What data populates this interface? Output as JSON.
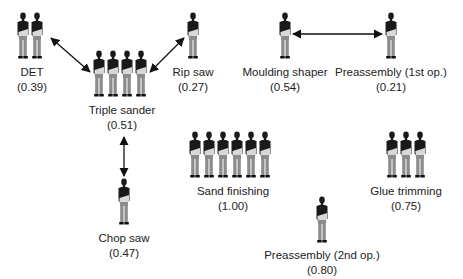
{
  "stations": [
    {
      "id": "det",
      "name": "DET",
      "value": "(0.39)",
      "workers": 2,
      "x": 16,
      "y": 12,
      "label_x": 32,
      "label_y": 65
    },
    {
      "id": "triple-sander",
      "name": "Triple sander",
      "value": "(0.51)",
      "workers": 4,
      "x": 92,
      "y": 50,
      "label_x": 122,
      "label_y": 103
    },
    {
      "id": "rip-saw",
      "name": "Rip saw",
      "value": "(0.27)",
      "workers": 1,
      "x": 186,
      "y": 12,
      "label_x": 193,
      "label_y": 65
    },
    {
      "id": "moulding-shaper",
      "name": "Moulding shaper",
      "value": "(0.54)",
      "workers": 1,
      "x": 278,
      "y": 12,
      "label_x": 285,
      "label_y": 65
    },
    {
      "id": "preassembly-1st",
      "name": "Preassembly (1st op.)",
      "value": "(0.21)",
      "workers": 1,
      "x": 384,
      "y": 12,
      "label_x": 391,
      "label_y": 65
    },
    {
      "id": "sand-finishing",
      "name": "Sand finishing",
      "value": "(1.00)",
      "workers": 6,
      "x": 188,
      "y": 131,
      "label_x": 233,
      "label_y": 184
    },
    {
      "id": "chop-saw",
      "name": "Chop saw",
      "value": "(0.47)",
      "workers": 1,
      "x": 117,
      "y": 178,
      "label_x": 124,
      "label_y": 231
    },
    {
      "id": "glue-trimming",
      "name": "Glue trimming",
      "value": "(0.75)",
      "workers": 3,
      "x": 385,
      "y": 131,
      "label_x": 406,
      "label_y": 184
    },
    {
      "id": "preassembly-2nd",
      "name": "Preassembly (2nd op.)",
      "value": "(0.80)",
      "workers": 1,
      "x": 315,
      "y": 196,
      "label_x": 322,
      "label_y": 248
    }
  ],
  "connections": [
    {
      "from": "det",
      "to": "triple-sander"
    },
    {
      "from": "rip-saw",
      "to": "triple-sander"
    },
    {
      "from": "moulding-shaper",
      "to": "preassembly-1st"
    },
    {
      "from": "triple-sander",
      "to": "chop-saw"
    }
  ],
  "colors": {
    "shirt": "#1a1a1a",
    "pants": "#8c8c8c",
    "apron": "#d8d8d8",
    "text": "#222222",
    "arrow": "#111111"
  }
}
